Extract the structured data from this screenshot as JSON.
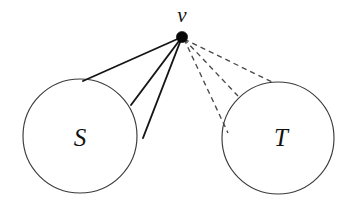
{
  "figure": {
    "kind": "graph-diagram",
    "background_color": "#ffffff"
  },
  "vertex": {
    "label": "v",
    "label_x": 182,
    "label_y": 17,
    "dot_x": 182,
    "dot_y": 37,
    "dot_radius": 5.6,
    "color": "#080808"
  },
  "regions": [
    {
      "id": "S",
      "label": "S",
      "cx": 80,
      "cy": 136,
      "r": 57,
      "label_x": 80,
      "label_y": 140,
      "stroke": "#3b3b3b"
    },
    {
      "id": "T",
      "label": "T",
      "cx": 278,
      "cy": 138,
      "r": 56,
      "label_x": 281,
      "label_y": 140,
      "stroke": "#3b3b3b"
    }
  ],
  "edges": {
    "solid": {
      "style": "solid",
      "target": "S",
      "color": "#161616",
      "count": 3,
      "lines": [
        {
          "x1": 182,
          "y1": 37,
          "x2": 83,
          "y2": 81
        },
        {
          "x1": 182,
          "y1": 37,
          "x2": 131,
          "y2": 105
        },
        {
          "x1": 182,
          "y1": 37,
          "x2": 143,
          "y2": 138
        }
      ]
    },
    "dashed": {
      "style": "dashed",
      "target": "T",
      "color": "#4a4a4a",
      "count": 3,
      "lines": [
        {
          "x1": 184,
          "y1": 39,
          "x2": 272,
          "y2": 82
        },
        {
          "x1": 184,
          "y1": 39,
          "x2": 238,
          "y2": 96
        },
        {
          "x1": 184,
          "y1": 39,
          "x2": 228,
          "y2": 133
        }
      ]
    }
  }
}
